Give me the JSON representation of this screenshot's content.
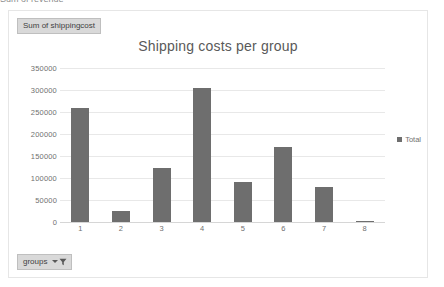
{
  "top_sliver": {
    "text": "Sum of revenue"
  },
  "chart_frame": {
    "value_field_button": {
      "label": "Sum of shippingcost",
      "icon": "pivot-field-icon"
    },
    "groups_field_button": {
      "label": "groups",
      "caret_icon": "chevron-down-icon",
      "filter_icon": "funnel-filter-icon"
    }
  },
  "chart_data": {
    "type": "bar",
    "title": "Shipping costs per group",
    "xlabel": "",
    "ylabel": "",
    "categories": [
      "1",
      "2",
      "3",
      "4",
      "5",
      "6",
      "7",
      "8"
    ],
    "series": [
      {
        "name": "Total",
        "color": "#6e6e6e",
        "values": [
          258000,
          25000,
          123000,
          305000,
          91000,
          170000,
          80000,
          2000
        ]
      }
    ],
    "ylim": [
      0,
      350000
    ],
    "yticks": [
      350000,
      300000,
      250000,
      200000,
      150000,
      100000,
      50000,
      0
    ],
    "ytick_labels": [
      "350000",
      "300000",
      "250000",
      "200000",
      "150000",
      "100000",
      "50000",
      "0"
    ],
    "grid": true,
    "legend": {
      "position": "right",
      "entries": [
        "Total"
      ]
    }
  }
}
